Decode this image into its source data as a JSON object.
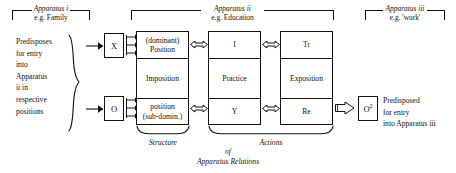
{
  "diagram": {
    "brackets": [
      {
        "name": "apparatus-i",
        "title": "Apparatus i",
        "subtitle": "e.g. Family"
      },
      {
        "name": "apparatus-ii",
        "title": "Apparatus ii",
        "subtitle": "e.g. Education"
      },
      {
        "name": "apparatus-iii",
        "title": "Apparatus iii",
        "subtitle": "e.g. 'work'"
      }
    ],
    "left_note": {
      "lines": [
        "Predisposes",
        "for entry",
        "into",
        "Apparatus",
        "ii in",
        "respective",
        "positions"
      ]
    },
    "agents": [
      {
        "name": "agent-x",
        "label": "X"
      },
      {
        "name": "agent-o",
        "label": "O"
      }
    ],
    "output": {
      "box_label": "O",
      "box_superscript": "2",
      "note_lines": [
        "Predisposed",
        "for entry",
        "into Apparatus iii"
      ]
    },
    "columns": [
      {
        "name": "structure-column",
        "cells": [
          {
            "line1": "(dominant)",
            "line2": "Position"
          },
          {
            "line1": "Imposition",
            "line2": ""
          },
          {
            "line1": "position",
            "line2": "(sub-domin.)"
          }
        ]
      },
      {
        "name": "actions-column-1",
        "cells": [
          {
            "line1": "I",
            "line2": ""
          },
          {
            "line1": "Practice",
            "line2": ""
          },
          {
            "line1": "Y",
            "line2": ""
          }
        ]
      },
      {
        "name": "actions-column-2",
        "cells": [
          {
            "line1": "Tr",
            "line2": ""
          },
          {
            "line1": "Exposition",
            "line2": ""
          },
          {
            "line1": "Re",
            "line2": ""
          }
        ]
      }
    ],
    "captions": {
      "structure": "Structure",
      "actions": "Actions",
      "of": "of",
      "apparatus_relations": "Apparatus Relations"
    },
    "colors": {
      "ink": "#111111",
      "paper": "#ffffff"
    }
  }
}
